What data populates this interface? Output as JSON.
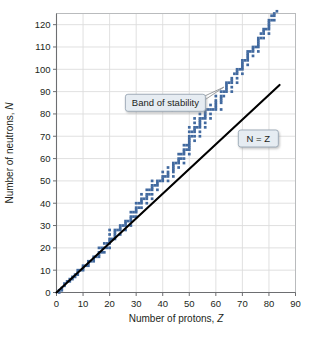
{
  "chart_data": {
    "type": "scatter",
    "title": "",
    "xlabel": "Number of protons, Z",
    "ylabel": "Number of neutrons, N",
    "xlim": [
      0,
      90
    ],
    "ylim": [
      0,
      125
    ],
    "xticks": [
      0,
      10,
      20,
      30,
      40,
      50,
      60,
      70,
      80,
      90
    ],
    "yticks": [
      0,
      10,
      20,
      30,
      40,
      50,
      60,
      70,
      80,
      90,
      100,
      110,
      120
    ],
    "grid": true,
    "legend": "none",
    "colors": {
      "band": "#41699f",
      "band_light": "#6f92bd",
      "reference_line": "#000000",
      "grid": "#dcdcdc",
      "axis": "#6d6e71",
      "callout_fill": "#e6ecf2",
      "callout_border": "#9aa7b4",
      "background": "#ffffff"
    },
    "annotations": [
      {
        "name": "band-of-stability",
        "label": "Band of stability",
        "box_x": 41,
        "box_y": 85,
        "point_x": 63,
        "point_y": 92
      },
      {
        "name": "n-equals-z",
        "label": "N = Z",
        "label_parts": {
          "lhs": "N",
          "op": " = ",
          "rhs": "Z"
        },
        "box_x": 76,
        "box_y": 69
      }
    ],
    "series": [
      {
        "name": "N = Z reference line",
        "type": "line",
        "points": [
          [
            0,
            0
          ],
          [
            84,
            93
          ]
        ]
      },
      {
        "name": "Band of stability (stable nuclides)",
        "type": "scatter",
        "marker": "square",
        "comment": "Approximate N values of stable nuclides vs Z; each Z may have several N values.",
        "points": [
          [
            1,
            0
          ],
          [
            1,
            1
          ],
          [
            2,
            1
          ],
          [
            2,
            2
          ],
          [
            3,
            3
          ],
          [
            3,
            4
          ],
          [
            4,
            5
          ],
          [
            5,
            5
          ],
          [
            5,
            6
          ],
          [
            6,
            6
          ],
          [
            6,
            7
          ],
          [
            7,
            7
          ],
          [
            7,
            8
          ],
          [
            8,
            8
          ],
          [
            8,
            9
          ],
          [
            8,
            10
          ],
          [
            9,
            10
          ],
          [
            10,
            10
          ],
          [
            10,
            11
          ],
          [
            10,
            12
          ],
          [
            11,
            12
          ],
          [
            12,
            12
          ],
          [
            12,
            13
          ],
          [
            12,
            14
          ],
          [
            13,
            14
          ],
          [
            14,
            14
          ],
          [
            14,
            15
          ],
          [
            14,
            16
          ],
          [
            15,
            16
          ],
          [
            16,
            16
          ],
          [
            16,
            17
          ],
          [
            16,
            18
          ],
          [
            16,
            20
          ],
          [
            17,
            18
          ],
          [
            17,
            20
          ],
          [
            18,
            18
          ],
          [
            18,
            20
          ],
          [
            18,
            22
          ],
          [
            19,
            20
          ],
          [
            19,
            22
          ],
          [
            20,
            20
          ],
          [
            20,
            22
          ],
          [
            20,
            23
          ],
          [
            20,
            24
          ],
          [
            20,
            26
          ],
          [
            20,
            28
          ],
          [
            21,
            24
          ],
          [
            22,
            24
          ],
          [
            22,
            25
          ],
          [
            22,
            26
          ],
          [
            22,
            27
          ],
          [
            22,
            28
          ],
          [
            23,
            28
          ],
          [
            24,
            26
          ],
          [
            24,
            28
          ],
          [
            24,
            29
          ],
          [
            24,
            30
          ],
          [
            25,
            30
          ],
          [
            26,
            28
          ],
          [
            26,
            30
          ],
          [
            26,
            31
          ],
          [
            26,
            32
          ],
          [
            27,
            32
          ],
          [
            28,
            30
          ],
          [
            28,
            32
          ],
          [
            28,
            33
          ],
          [
            28,
            34
          ],
          [
            28,
            36
          ],
          [
            29,
            34
          ],
          [
            29,
            36
          ],
          [
            30,
            34
          ],
          [
            30,
            36
          ],
          [
            30,
            37
          ],
          [
            30,
            38
          ],
          [
            30,
            40
          ],
          [
            31,
            38
          ],
          [
            31,
            40
          ],
          [
            32,
            38
          ],
          [
            32,
            40
          ],
          [
            32,
            41
          ],
          [
            32,
            42
          ],
          [
            32,
            44
          ],
          [
            33,
            42
          ],
          [
            34,
            40
          ],
          [
            34,
            42
          ],
          [
            34,
            43
          ],
          [
            34,
            44
          ],
          [
            34,
            46
          ],
          [
            35,
            44
          ],
          [
            35,
            46
          ],
          [
            36,
            42
          ],
          [
            36,
            44
          ],
          [
            36,
            46
          ],
          [
            36,
            47
          ],
          [
            36,
            48
          ],
          [
            36,
            50
          ],
          [
            37,
            48
          ],
          [
            38,
            46
          ],
          [
            38,
            48
          ],
          [
            38,
            49
          ],
          [
            38,
            50
          ],
          [
            39,
            50
          ],
          [
            40,
            50
          ],
          [
            40,
            51
          ],
          [
            40,
            52
          ],
          [
            40,
            54
          ],
          [
            41,
            52
          ],
          [
            42,
            50
          ],
          [
            42,
            52
          ],
          [
            42,
            53
          ],
          [
            42,
            54
          ],
          [
            42,
            56
          ],
          [
            44,
            52
          ],
          [
            44,
            54
          ],
          [
            44,
            55
          ],
          [
            44,
            56
          ],
          [
            44,
            57
          ],
          [
            44,
            58
          ],
          [
            45,
            58
          ],
          [
            46,
            56
          ],
          [
            46,
            58
          ],
          [
            46,
            59
          ],
          [
            46,
            60
          ],
          [
            46,
            62
          ],
          [
            47,
            60
          ],
          [
            47,
            62
          ],
          [
            48,
            58
          ],
          [
            48,
            60
          ],
          [
            48,
            62
          ],
          [
            48,
            63
          ],
          [
            48,
            64
          ],
          [
            48,
            66
          ],
          [
            49,
            64
          ],
          [
            49,
            66
          ],
          [
            50,
            62
          ],
          [
            50,
            64
          ],
          [
            50,
            65
          ],
          [
            50,
            66
          ],
          [
            50,
            67
          ],
          [
            50,
            68
          ],
          [
            50,
            69
          ],
          [
            50,
            70
          ],
          [
            50,
            72
          ],
          [
            50,
            74
          ],
          [
            51,
            70
          ],
          [
            51,
            72
          ],
          [
            52,
            68
          ],
          [
            52,
            70
          ],
          [
            52,
            72
          ],
          [
            52,
            73
          ],
          [
            52,
            74
          ],
          [
            52,
            76
          ],
          [
            52,
            78
          ],
          [
            53,
            74
          ],
          [
            54,
            70
          ],
          [
            54,
            72
          ],
          [
            54,
            74
          ],
          [
            54,
            75
          ],
          [
            54,
            76
          ],
          [
            54,
            77
          ],
          [
            54,
            78
          ],
          [
            54,
            80
          ],
          [
            54,
            82
          ],
          [
            55,
            78
          ],
          [
            56,
            74
          ],
          [
            56,
            76
          ],
          [
            56,
            78
          ],
          [
            56,
            79
          ],
          [
            56,
            80
          ],
          [
            56,
            81
          ],
          [
            56,
            82
          ],
          [
            57,
            82
          ],
          [
            58,
            78
          ],
          [
            58,
            80
          ],
          [
            58,
            82
          ],
          [
            58,
            84
          ],
          [
            59,
            82
          ],
          [
            60,
            82
          ],
          [
            60,
            83
          ],
          [
            60,
            84
          ],
          [
            60,
            85
          ],
          [
            60,
            86
          ],
          [
            60,
            88
          ],
          [
            62,
            82
          ],
          [
            62,
            85
          ],
          [
            62,
            86
          ],
          [
            62,
            87
          ],
          [
            62,
            88
          ],
          [
            62,
            90
          ],
          [
            63,
            88
          ],
          [
            63,
            90
          ],
          [
            64,
            90
          ],
          [
            64,
            91
          ],
          [
            64,
            92
          ],
          [
            64,
            93
          ],
          [
            64,
            94
          ],
          [
            65,
            94
          ],
          [
            66,
            90
          ],
          [
            66,
            92
          ],
          [
            66,
            94
          ],
          [
            66,
            95
          ],
          [
            66,
            96
          ],
          [
            67,
            98
          ],
          [
            68,
            94
          ],
          [
            68,
            96
          ],
          [
            68,
            98
          ],
          [
            68,
            99
          ],
          [
            68,
            100
          ],
          [
            69,
            100
          ],
          [
            70,
            98
          ],
          [
            70,
            100
          ],
          [
            70,
            101
          ],
          [
            70,
            102
          ],
          [
            70,
            103
          ],
          [
            70,
            104
          ],
          [
            71,
            104
          ],
          [
            72,
            102
          ],
          [
            72,
            104
          ],
          [
            72,
            105
          ],
          [
            72,
            106
          ],
          [
            72,
            107
          ],
          [
            72,
            108
          ],
          [
            73,
            108
          ],
          [
            74,
            106
          ],
          [
            74,
            108
          ],
          [
            74,
            109
          ],
          [
            74,
            110
          ],
          [
            75,
            110
          ],
          [
            76,
            108
          ],
          [
            76,
            110
          ],
          [
            76,
            111
          ],
          [
            76,
            112
          ],
          [
            76,
            113
          ],
          [
            76,
            114
          ],
          [
            77,
            114
          ],
          [
            77,
            116
          ],
          [
            78,
            114
          ],
          [
            78,
            116
          ],
          [
            78,
            117
          ],
          [
            78,
            118
          ],
          [
            79,
            118
          ],
          [
            80,
            116
          ],
          [
            80,
            118
          ],
          [
            80,
            119
          ],
          [
            80,
            120
          ],
          [
            80,
            121
          ],
          [
            80,
            122
          ],
          [
            81,
            122
          ],
          [
            81,
            124
          ],
          [
            82,
            122
          ],
          [
            82,
            124
          ],
          [
            82,
            125
          ],
          [
            83,
            126
          ]
        ]
      }
    ]
  }
}
